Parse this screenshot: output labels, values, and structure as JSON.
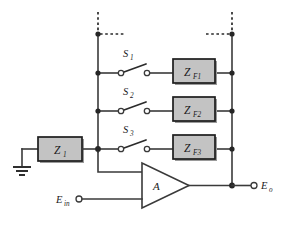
{
  "diagram": {
    "type": "circuit-schematic"
  },
  "input_stage": {
    "ground_label": "",
    "input_impedance_symbol": "Z",
    "input_impedance_subscript": "1"
  },
  "amplifier": {
    "label": "A"
  },
  "terminals": {
    "input_symbol": "E",
    "input_subscript": "in",
    "output_symbol": "E",
    "output_subscript": "o"
  },
  "feedback_branches": [
    {
      "switch_symbol": "S",
      "switch_subscript": "1",
      "impedance_symbol": "Z",
      "impedance_subscript": "F1",
      "state": "open"
    },
    {
      "switch_symbol": "S",
      "switch_subscript": "2",
      "impedance_symbol": "Z",
      "impedance_subscript": "F2",
      "state": "open"
    },
    {
      "switch_symbol": "S",
      "switch_subscript": "3",
      "impedance_symbol": "Z",
      "impedance_subscript": "F3",
      "state": "open"
    }
  ],
  "rails": {
    "left_rail_continuation": "dashed",
    "right_rail_continuation": "dashed"
  },
  "colors": {
    "block_fill": "#c3c3c3",
    "block_border": "#1d1d1d",
    "wire": "#3a3a3a",
    "background": "#ffffff"
  }
}
